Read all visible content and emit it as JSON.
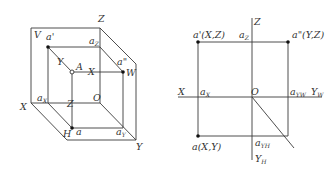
{
  "left_figure": {
    "description": "Three-projection-plane cube (V, H, W) with point A and its projections",
    "labels": {
      "Z_top": "Z",
      "V": "V",
      "a_prime": "a'",
      "a_z": "a",
      "a_z_sub": "Z",
      "a_dprime": "a\"",
      "Y_mid": "Y",
      "A": "A",
      "X_mid": "X",
      "W": "W",
      "a_x": "a",
      "a_x_sub": "X",
      "Z_mid": "Z",
      "O": "O",
      "X_left": "X",
      "H": "H",
      "a": "a",
      "a_y": "a",
      "a_y_sub": "Y",
      "Y_bottom": "Y"
    }
  },
  "right_figure": {
    "description": "Unfolded orthographic projection of point A",
    "labels": {
      "Z": "Z",
      "a_prime": "a'(X,Z)",
      "a_z": "a",
      "a_z_sub": "Z",
      "a_dprime": "a\"(Y,Z)",
      "X": "X",
      "a_x": "a",
      "a_x_sub": "X",
      "O": "O",
      "a_yw": "a",
      "a_yw_sub": "YW",
      "Y_W": "Y",
      "Y_W_sub": "W",
      "a": "a(X,Y)",
      "a_yh": "a",
      "a_yh_sub": "YH",
      "Y_H": "Y",
      "Y_H_sub": "H"
    }
  }
}
